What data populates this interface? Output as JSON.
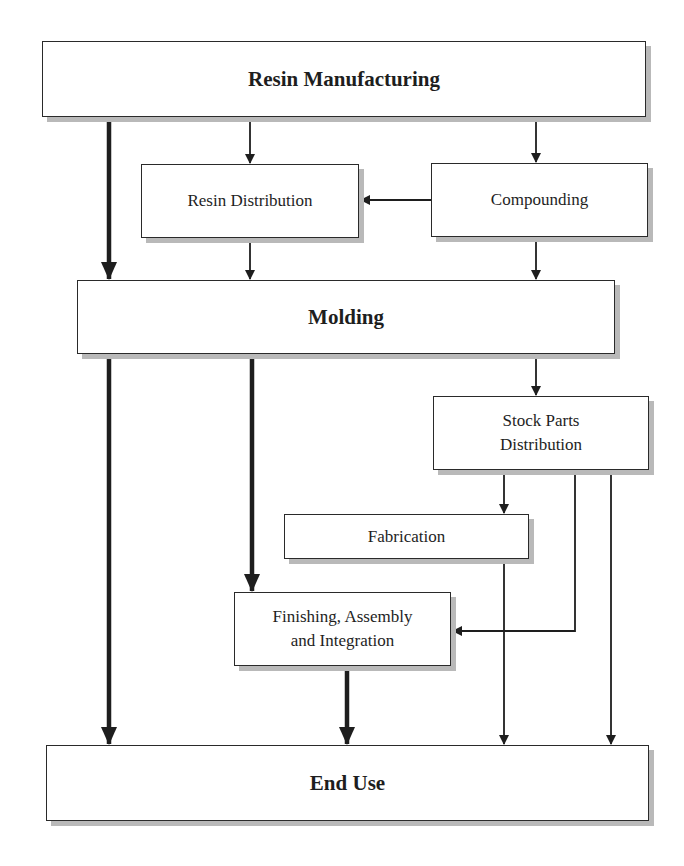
{
  "diagram": {
    "type": "flowchart",
    "nodes": {
      "resin_manufacturing": "Resin Manufacturing",
      "resin_distribution": "Resin Distribution",
      "compounding": "Compounding",
      "molding": "Molding",
      "stock_parts_distribution": "Stock Parts\nDistribution",
      "fabrication": "Fabrication",
      "finishing_assembly_integration": "Finishing, Assembly\nand Integration",
      "end_use": "End Use"
    },
    "edges": [
      {
        "from": "Resin Manufacturing",
        "to": "Molding",
        "weight": "thick"
      },
      {
        "from": "Resin Manufacturing",
        "to": "Resin Distribution",
        "weight": "thin"
      },
      {
        "from": "Resin Manufacturing",
        "to": "Compounding",
        "weight": "thin"
      },
      {
        "from": "Compounding",
        "to": "Resin Distribution",
        "weight": "thin"
      },
      {
        "from": "Resin Distribution",
        "to": "Molding",
        "weight": "thin"
      },
      {
        "from": "Compounding",
        "to": "Molding",
        "weight": "thin"
      },
      {
        "from": "Molding",
        "to": "End Use",
        "weight": "thick"
      },
      {
        "from": "Molding",
        "to": "Finishing, Assembly and Integration",
        "weight": "thick"
      },
      {
        "from": "Molding",
        "to": "Stock Parts Distribution",
        "weight": "thin"
      },
      {
        "from": "Stock Parts Distribution",
        "to": "Fabrication",
        "weight": "thin"
      },
      {
        "from": "Stock Parts Distribution",
        "to": "Finishing, Assembly and Integration",
        "weight": "thin"
      },
      {
        "from": "Stock Parts Distribution",
        "to": "End Use",
        "weight": "thin"
      },
      {
        "from": "Fabrication",
        "to": "End Use",
        "weight": "thin"
      },
      {
        "from": "Finishing, Assembly and Integration",
        "to": "End Use",
        "weight": "thick"
      }
    ],
    "colors": {
      "line": "#1e1e1e",
      "box_border": "#2a2a2a",
      "box_shadow": "#b9b9b9",
      "background": "#ffffff"
    }
  }
}
